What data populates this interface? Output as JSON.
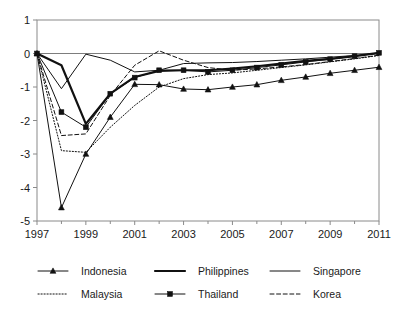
{
  "chart_data": {
    "type": "line",
    "title": "",
    "subtitle": "",
    "xlabel": "",
    "ylabel": "",
    "xlim": [
      1997,
      2011
    ],
    "ylim": [
      -5,
      1
    ],
    "yticks": [
      1,
      0,
      -1,
      -2,
      -3,
      -4,
      -5
    ],
    "ytick_labels": [
      "1",
      "0",
      "-1",
      "-2",
      "-3",
      "-4",
      "-5"
    ],
    "xticks": [
      1997,
      1999,
      2001,
      2003,
      2005,
      2007,
      2009,
      2011
    ],
    "xtick_labels": [
      "1997",
      "1999",
      "2001",
      "2003",
      "2005",
      "2007",
      "2009",
      "2011"
    ],
    "minor_xticks": [
      1998,
      2000,
      2002,
      2004,
      2006,
      2008,
      2010
    ],
    "grid": false,
    "zero_line": true,
    "legend_position": "below",
    "legend_columns": 3,
    "x": [
      1997,
      1998,
      1999,
      2000,
      2001,
      2002,
      2003,
      2004,
      2005,
      2006,
      2007,
      2008,
      2009,
      2010,
      2011
    ],
    "series": [
      {
        "name": "Indonesia",
        "style": "thin-solid-triangle",
        "marker": "triangle",
        "values": [
          0.0,
          -4.6,
          -3.0,
          -1.9,
          -0.92,
          -0.93,
          -1.06,
          -1.08,
          -1.0,
          -0.93,
          -0.8,
          -0.7,
          -0.59,
          -0.5,
          -0.41
        ]
      },
      {
        "name": "Philippines",
        "style": "thick-solid",
        "marker": "none",
        "values": [
          0.0,
          -0.35,
          -2.1,
          -1.2,
          -0.7,
          -0.52,
          -0.5,
          -0.5,
          -0.45,
          -0.38,
          -0.3,
          -0.22,
          -0.16,
          -0.08,
          0.02
        ]
      },
      {
        "name": "Singapore",
        "style": "thin-solid",
        "marker": "none",
        "values": [
          0.0,
          -1.05,
          -0.02,
          -0.2,
          -0.55,
          -0.5,
          -0.3,
          -0.28,
          -0.27,
          -0.24,
          -0.2,
          -0.16,
          -0.11,
          -0.06,
          0.0
        ]
      },
      {
        "name": "Malaysia",
        "style": "dotted",
        "marker": "none",
        "values": [
          0.0,
          -2.9,
          -2.95,
          -2.2,
          -1.55,
          -1.0,
          -0.75,
          -0.63,
          -0.58,
          -0.5,
          -0.42,
          -0.34,
          -0.25,
          -0.16,
          -0.06
        ]
      },
      {
        "name": "Thailand",
        "style": "thin-solid-square",
        "marker": "square",
        "values": [
          0.0,
          -1.75,
          -2.2,
          -1.2,
          -0.72,
          -0.5,
          -0.5,
          -0.55,
          -0.5,
          -0.42,
          -0.34,
          -0.25,
          -0.17,
          -0.08,
          0.02
        ]
      },
      {
        "name": "Korea",
        "style": "dashed",
        "marker": "none",
        "values": [
          0.0,
          -2.45,
          -2.4,
          -1.25,
          -0.35,
          0.08,
          -0.2,
          -0.42,
          -0.5,
          -0.46,
          -0.4,
          -0.33,
          -0.24,
          -0.15,
          -0.05
        ]
      }
    ]
  },
  "legend": {
    "entries": [
      {
        "label": "Indonesia",
        "style": "thin-solid-triangle"
      },
      {
        "label": "Philippines",
        "style": "thick-solid"
      },
      {
        "label": "Singapore",
        "style": "thin-solid"
      },
      {
        "label": "Malaysia",
        "style": "dotted"
      },
      {
        "label": "Thailand",
        "style": "thin-solid-square"
      },
      {
        "label": "Korea",
        "style": "dashed"
      }
    ]
  }
}
